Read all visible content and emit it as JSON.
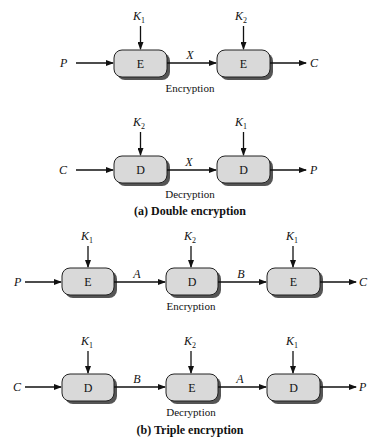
{
  "diagram": {
    "double_encryption": {
      "caption": "(a) Double encryption",
      "encryption": {
        "label": "Encryption",
        "input": "P",
        "output": "C",
        "intermediates": [
          "X"
        ],
        "stages": [
          {
            "op": "E",
            "key": "K",
            "key_sub": "1"
          },
          {
            "op": "E",
            "key": "K",
            "key_sub": "2"
          }
        ]
      },
      "decryption": {
        "label": "Decryption",
        "input": "C",
        "output": "P",
        "intermediates": [
          "X"
        ],
        "stages": [
          {
            "op": "D",
            "key": "K",
            "key_sub": "2"
          },
          {
            "op": "D",
            "key": "K",
            "key_sub": "1"
          }
        ]
      }
    },
    "triple_encryption": {
      "caption": "(b) Triple encryption",
      "encryption": {
        "label": "Encryption",
        "input": "P",
        "output": "C",
        "intermediates": [
          "A",
          "B"
        ],
        "stages": [
          {
            "op": "E",
            "key": "K",
            "key_sub": "1"
          },
          {
            "op": "D",
            "key": "K",
            "key_sub": "2"
          },
          {
            "op": "E",
            "key": "K",
            "key_sub": "1"
          }
        ]
      },
      "decryption": {
        "label": "Decryption",
        "input": "C",
        "output": "P",
        "intermediates": [
          "B",
          "A"
        ],
        "stages": [
          {
            "op": "D",
            "key": "K",
            "key_sub": "1"
          },
          {
            "op": "E",
            "key": "K",
            "key_sub": "2"
          },
          {
            "op": "D",
            "key": "K",
            "key_sub": "1"
          }
        ]
      }
    }
  }
}
